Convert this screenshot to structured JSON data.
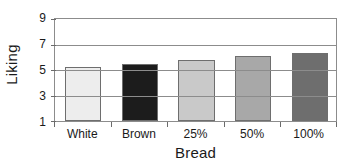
{
  "chart_data": {
    "type": "bar",
    "title": "",
    "xlabel": "Bread",
    "ylabel": "Liking",
    "categories": [
      "White",
      "Brown",
      "25%",
      "50%",
      "100%"
    ],
    "values": [
      5.2,
      5.5,
      5.8,
      6.1,
      6.3
    ],
    "series": [
      {
        "name": "Liking",
        "values": [
          5.2,
          5.5,
          5.8,
          6.1,
          6.3
        ]
      }
    ],
    "ylim": [
      1,
      9
    ],
    "yticks": [
      1,
      3,
      5,
      7,
      9
    ],
    "ytick_labels": [
      "1",
      "3",
      "5",
      "7",
      "9"
    ],
    "grid": "horizontal",
    "legend": "none",
    "bar_colors": [
      "#ededed",
      "#1c1c1c",
      "#c9c9c9",
      "#a8a8a8",
      "#6e6e6e"
    ],
    "bar_edge_color": "#6e6e6e",
    "axis_color": "#8c8c8c",
    "text_color": "#1a1a1a",
    "background": "#ffffff"
  }
}
